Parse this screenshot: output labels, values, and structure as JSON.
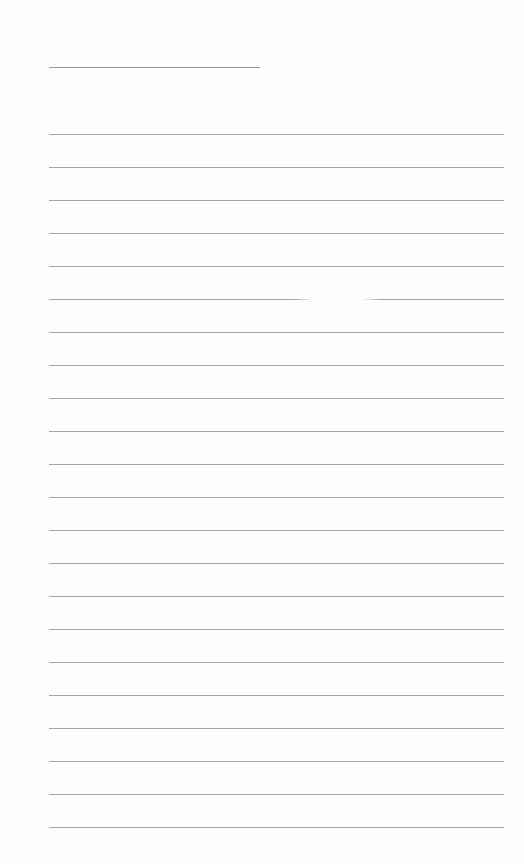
{
  "page": {
    "type": "lined-paper",
    "background_color": "#fefefe",
    "line_color": "#a6a6a6",
    "title_line": {
      "x": 49,
      "y": 67,
      "width": 211
    },
    "rules": {
      "count": 22,
      "x": 49,
      "width": 455,
      "first_y": 134,
      "spacing": 33
    },
    "faded_segment": {
      "line_index": 5,
      "x_start": 315,
      "x_end": 360
    }
  }
}
